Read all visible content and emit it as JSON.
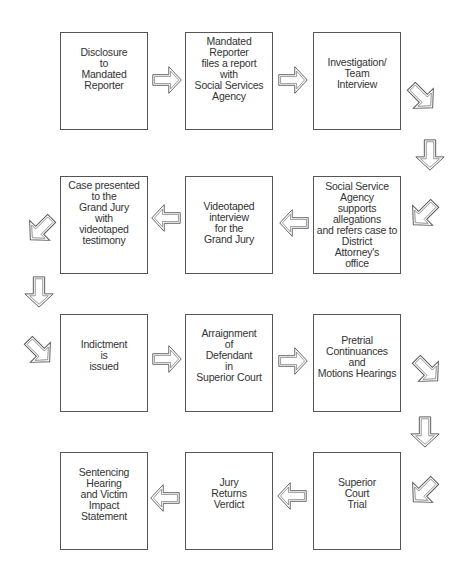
{
  "diagram": {
    "type": "flowchart",
    "colors": {
      "box_border": "#555555",
      "arrow_stroke": "#555555",
      "text": "#333333",
      "background": "#ffffff"
    },
    "steps": [
      {
        "id": 1,
        "label": "Disclosure\nto\nMandated\nReporter"
      },
      {
        "id": 2,
        "label": "Mandated\nReporter\nfiles a report\nwith\nSocial Services\nAgency"
      },
      {
        "id": 3,
        "label": "Investigation/\nTeam\nInterview"
      },
      {
        "id": 4,
        "label": "Social Service\nAgency\nsupports\nallegations\nand refers case to\nDistrict\nAttorney's\noffice"
      },
      {
        "id": 5,
        "label": "Videotaped\ninterview\nfor the\nGrand Jury"
      },
      {
        "id": 6,
        "label": "Case presented\nto the\nGrand Jury\nwith\nvideotaped\ntestimony"
      },
      {
        "id": 7,
        "label": "Indictment\nis\nissued"
      },
      {
        "id": 8,
        "label": "Arraignment\nof\nDefendant\nin\nSuperior Court"
      },
      {
        "id": 9,
        "label": "Pretrial\nContinuances\nand\nMotions Hearings"
      },
      {
        "id": 10,
        "label": "Superior\nCourt\nTrial"
      },
      {
        "id": 11,
        "label": "Jury\nReturns\nVerdict"
      },
      {
        "id": 12,
        "label": "Sentencing\nHearing\nand Victim\nImpact\nStatement"
      }
    ],
    "arrows": [
      {
        "from": 1,
        "to": 2,
        "direction": "right"
      },
      {
        "from": 2,
        "to": 3,
        "direction": "right"
      },
      {
        "from": 3,
        "to": 4,
        "direction": "down-right, down, down-left"
      },
      {
        "from": 4,
        "to": 5,
        "direction": "left"
      },
      {
        "from": 5,
        "to": 6,
        "direction": "left"
      },
      {
        "from": 6,
        "to": 7,
        "direction": "down-left, down, down-right"
      },
      {
        "from": 7,
        "to": 8,
        "direction": "right"
      },
      {
        "from": 8,
        "to": 9,
        "direction": "right"
      },
      {
        "from": 9,
        "to": 10,
        "direction": "down-right, down, down-left"
      },
      {
        "from": 10,
        "to": 11,
        "direction": "left"
      },
      {
        "from": 11,
        "to": 12,
        "direction": "left"
      }
    ]
  }
}
